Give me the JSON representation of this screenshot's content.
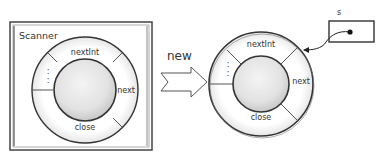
{
  "left_object": {
    "box_label": "Scanner",
    "segments": {
      "top": "nextInt",
      "right": "next",
      "bottom": "close",
      "left": ":"
    }
  },
  "arrow": {
    "label": "new"
  },
  "right_object": {
    "segments": {
      "top": "nextInt",
      "right": "next",
      "bottom": "close",
      "left": ":"
    }
  },
  "reference": {
    "variable_name": "s"
  }
}
